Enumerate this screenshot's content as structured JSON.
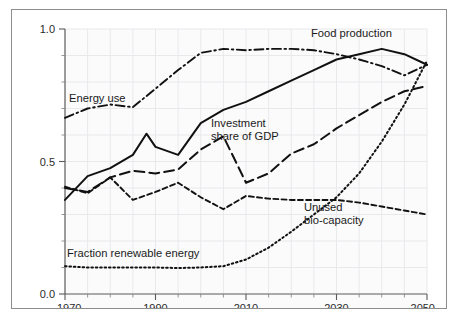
{
  "figure": {
    "background_color": "#ffffff",
    "frame_color": "#8d8d8d",
    "line_color": "#111111"
  },
  "axis": {
    "y_ticks": [
      "0.0",
      "0.5",
      "1.0"
    ],
    "x_ticks": [
      "1970",
      "1990",
      "2010",
      "2030",
      "2050"
    ]
  },
  "labels": {
    "food_production": "Food production",
    "energy_use": "Energy use",
    "investment_line1": "Investment",
    "investment_line2": "share of GDP",
    "unused_line1": "Unused",
    "unused_line2": "bio-capacity",
    "fraction_renewable": "Fraction renewable energy"
  },
  "chart_data": {
    "type": "line",
    "title": "",
    "xlabel": "",
    "ylabel": "",
    "xlim": [
      1970,
      2050
    ],
    "ylim": [
      0.0,
      1.0
    ],
    "grid": true,
    "legend": "inline-annotations",
    "x_tick_values": [
      1970,
      1990,
      2010,
      2030,
      2050
    ],
    "x_minor_tick_step": 5,
    "y_tick_values": [
      0.0,
      0.5,
      1.0
    ],
    "y_minor_tick_step": 0.1,
    "series": [
      {
        "name": "Food production",
        "style": "solid",
        "x": [
          1970,
          1975,
          1980,
          1985,
          1988,
          1990,
          1995,
          2000,
          2005,
          2010,
          2015,
          2020,
          2025,
          2030,
          2035,
          2040,
          2045,
          2050
        ],
        "values": [
          0.355,
          0.445,
          0.475,
          0.525,
          0.605,
          0.555,
          0.525,
          0.645,
          0.695,
          0.725,
          0.765,
          0.805,
          0.845,
          0.885,
          0.905,
          0.925,
          0.905,
          0.865
        ]
      },
      {
        "name": "Energy use",
        "style": "dash-dot",
        "x": [
          1970,
          1975,
          1980,
          1985,
          1990,
          1995,
          2000,
          2005,
          2010,
          2015,
          2020,
          2025,
          2030,
          2035,
          2040,
          2045,
          2050
        ],
        "values": [
          0.665,
          0.7,
          0.715,
          0.705,
          0.775,
          0.845,
          0.91,
          0.925,
          0.92,
          0.925,
          0.925,
          0.92,
          0.905,
          0.885,
          0.86,
          0.825,
          0.865
        ]
      },
      {
        "name": "Investment share of GDP",
        "style": "long-dash",
        "x": [
          1970,
          1975,
          1980,
          1985,
          1990,
          1995,
          2000,
          2005,
          2010,
          2015,
          2020,
          2025,
          2030,
          2035,
          2040,
          2045,
          2050
        ],
        "values": [
          0.4,
          0.385,
          0.44,
          0.465,
          0.455,
          0.47,
          0.545,
          0.595,
          0.42,
          0.455,
          0.53,
          0.565,
          0.625,
          0.675,
          0.725,
          0.765,
          0.785
        ]
      },
      {
        "name": "Unused bio-capacity",
        "style": "short-dash",
        "x": [
          1970,
          1975,
          1980,
          1985,
          1990,
          1995,
          2000,
          2005,
          2010,
          2015,
          2020,
          2025,
          2030,
          2035,
          2040,
          2045,
          2050
        ],
        "values": [
          0.405,
          0.38,
          0.44,
          0.355,
          0.385,
          0.42,
          0.365,
          0.32,
          0.37,
          0.36,
          0.355,
          0.355,
          0.355,
          0.345,
          0.33,
          0.315,
          0.3
        ]
      },
      {
        "name": "Fraction renewable energy",
        "style": "dotted",
        "x": [
          1970,
          1975,
          1980,
          1985,
          1990,
          1995,
          2000,
          2005,
          2010,
          2015,
          2020,
          2025,
          2030,
          2035,
          2040,
          2045,
          2050
        ],
        "values": [
          0.105,
          0.1,
          0.1,
          0.1,
          0.1,
          0.098,
          0.1,
          0.105,
          0.13,
          0.175,
          0.235,
          0.3,
          0.365,
          0.455,
          0.575,
          0.715,
          0.88
        ]
      }
    ]
  }
}
